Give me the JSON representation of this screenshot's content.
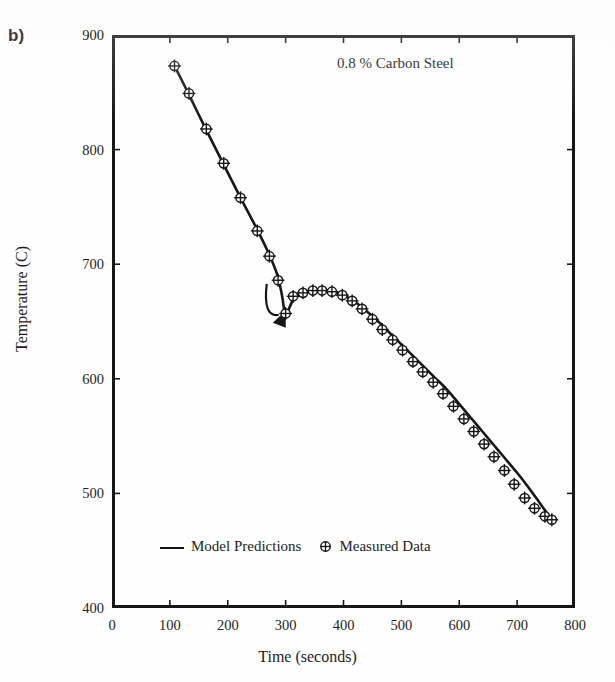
{
  "figure": {
    "panel_label": "b)",
    "annotation": "0.8 % Carbon Steel"
  },
  "legend": {
    "model_label": "Model Predictions",
    "measured_label": "Measured Data",
    "line_icon": "line-segment-icon",
    "marker_icon": "circle-plus-icon"
  },
  "colors": {
    "ink": "#171717",
    "paper": "#fefefe",
    "text": "#222222"
  },
  "chart_data": {
    "type": "line",
    "title": "0.8 % Carbon Steel",
    "xlabel": "Time (seconds)",
    "ylabel": "Temperature (C)",
    "xlim": [
      0,
      800
    ],
    "ylim": [
      400,
      900
    ],
    "xticks": [
      0,
      100,
      200,
      300,
      400,
      500,
      600,
      700,
      800
    ],
    "xtick_labels": [
      "0",
      "100",
      "200",
      "300",
      "400",
      "500",
      "600",
      "700",
      "800"
    ],
    "yticks": [
      400,
      500,
      600,
      700,
      800,
      900
    ],
    "ytick_labels": [
      "400",
      "500",
      "600",
      "700",
      "800",
      "900"
    ],
    "grid": false,
    "legend_position": "lower-left-inside",
    "annotations": [
      {
        "kind": "arrow",
        "note": "undercooling arrow pointing down to recalescence minimum",
        "x": 295,
        "y": 648
      }
    ],
    "series": [
      {
        "name": "Model Predictions",
        "style": "line",
        "x": [
          108,
          130,
          160,
          190,
          220,
          250,
          272,
          286,
          294,
          300,
          312,
          326,
          342,
          360,
          380,
          400,
          420,
          440,
          460,
          480,
          500,
          520,
          540,
          560,
          580,
          600,
          620,
          640,
          660,
          680,
          700,
          720,
          740,
          760
        ],
        "y": [
          873,
          851,
          820,
          790,
          760,
          731,
          708,
          690,
          672,
          656,
          668,
          674,
          676,
          677,
          676,
          673,
          667,
          659,
          650,
          640,
          630,
          620,
          610,
          600,
          590,
          578,
          566,
          554,
          542,
          530,
          518,
          505,
          491,
          477
        ]
      },
      {
        "name": "Measured Data",
        "style": "marker",
        "marker": "circle-plus",
        "x": [
          108,
          133,
          163,
          193,
          222,
          251,
          272,
          287,
          300,
          313,
          330,
          347,
          363,
          380,
          398,
          415,
          432,
          450,
          467,
          485,
          502,
          520,
          537,
          555,
          572,
          590,
          608,
          625,
          643,
          660,
          678,
          695,
          713,
          730,
          748,
          760
        ],
        "y": [
          873,
          849,
          818,
          788,
          758,
          729,
          707,
          686,
          657,
          672,
          675,
          677,
          677,
          676,
          673,
          668,
          661,
          652,
          643,
          634,
          625,
          615,
          606,
          597,
          587,
          576,
          565,
          554,
          543,
          532,
          520,
          508,
          496,
          487,
          480,
          477
        ]
      }
    ]
  }
}
